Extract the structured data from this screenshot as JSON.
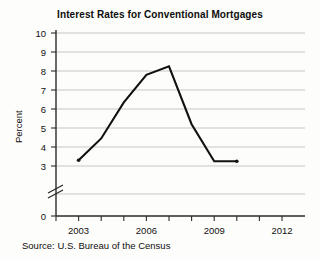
{
  "chart_data": {
    "type": "line",
    "title": "Interest Rates for Conventional Mortgages",
    "xlabel": "",
    "ylabel": "Percent",
    "x": [
      2003,
      2004,
      2005,
      2006,
      2007,
      2008,
      2009,
      2010
    ],
    "values": [
      3.3,
      4.45,
      6.35,
      7.8,
      8.25,
      5.2,
      3.25,
      3.25
    ],
    "series": [
      {
        "name": "Interest Rate",
        "values": [
          3.3,
          4.45,
          6.35,
          7.8,
          8.25,
          5.2,
          3.25,
          3.25
        ]
      }
    ],
    "xlim": [
      2002,
      2013
    ],
    "ylim": [
      3,
      10
    ],
    "y_axis_break": true,
    "y_zero_shown": true,
    "grid": true,
    "legend": "none",
    "y_tick_labels": [
      "0",
      "3",
      "4",
      "5",
      "6",
      "7",
      "8",
      "9",
      "10"
    ],
    "x_tick_labels": [
      "2003",
      "2006",
      "2009",
      "2012"
    ],
    "x_tick_years": [
      2002,
      2003,
      2004,
      2005,
      2006,
      2007,
      2008,
      2009,
      2010,
      2011,
      2012,
      2013
    ],
    "source": "Source: U.S. Bureau of the Census",
    "line_color": "#111111",
    "grid_color": "#b9b9b9",
    "axis_color": "#2a2a2a",
    "background_color": "#fdfdfb"
  }
}
